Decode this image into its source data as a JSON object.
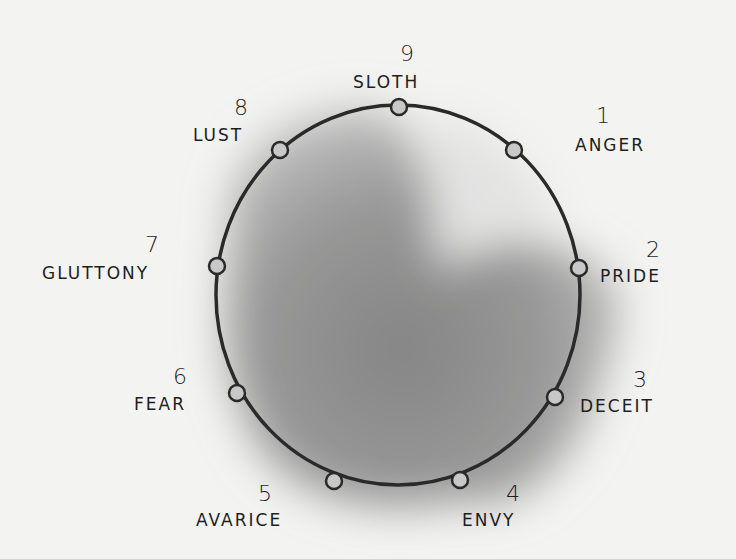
{
  "diagram": {
    "type": "circle-of-points",
    "shading_color": "#8c8c8c",
    "line_color": "#2a2a2a",
    "background": "#f3f3f1",
    "points": [
      {
        "number": "1",
        "label": "ANGER",
        "cx": 514,
        "cy": 150,
        "nx": 596,
        "ny": 104,
        "lx": 575,
        "ly": 135,
        "align": "left"
      },
      {
        "number": "2",
        "label": "PRIDE",
        "cx": 579,
        "cy": 268,
        "nx": 646,
        "ny": 238,
        "lx": 600,
        "ly": 266,
        "align": "left"
      },
      {
        "number": "3",
        "label": "DECEIT",
        "cx": 555,
        "cy": 397,
        "nx": 633,
        "ny": 368,
        "lx": 580,
        "ly": 396,
        "align": "left"
      },
      {
        "number": "4",
        "label": "ENVY",
        "cx": 460,
        "cy": 480,
        "nx": 506,
        "ny": 482,
        "lx": 462,
        "ly": 510,
        "align": "left"
      },
      {
        "number": "5",
        "label": "AVARICE",
        "cx": 334,
        "cy": 481,
        "nx": 258,
        "ny": 482,
        "lx": 196,
        "ly": 510,
        "align": "left"
      },
      {
        "number": "6",
        "label": "FEAR",
        "cx": 237,
        "cy": 393,
        "nx": 173,
        "ny": 365,
        "lx": 134,
        "ly": 394,
        "align": "left"
      },
      {
        "number": "7",
        "label": "GLUTTONY",
        "cx": 217,
        "cy": 266,
        "nx": 145,
        "ny": 233,
        "lx": 42,
        "ly": 263,
        "align": "left"
      },
      {
        "number": "8",
        "label": "LUST",
        "cx": 280,
        "cy": 150,
        "nx": 234,
        "ny": 96,
        "lx": 193,
        "ly": 125,
        "align": "left"
      },
      {
        "number": "9",
        "label": "SLOTH",
        "cx": 399,
        "cy": 107,
        "nx": 400,
        "ny": 42,
        "lx": 353,
        "ly": 72,
        "align": "left"
      }
    ]
  }
}
